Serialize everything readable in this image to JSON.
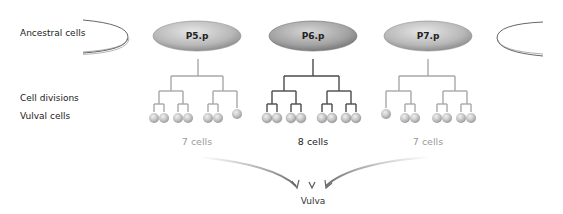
{
  "row_labels": {
    "ancestral": "Ancestral cells",
    "divisions": "Cell divisions",
    "vulval": "Vulval cells"
  },
  "precursors": [
    {
      "name": "P5.p",
      "cell_count_label": "7 cells",
      "cells": 7,
      "emphasis": "faint",
      "line_color": "#a8a8a8"
    },
    {
      "name": "P6.p",
      "cell_count_label": "8 cells",
      "cells": 8,
      "emphasis": "strong",
      "line_color": "#4a4a4a"
    },
    {
      "name": "P7.p",
      "cell_count_label": "7 cells",
      "cells": 7,
      "emphasis": "faint",
      "line_color": "#a8a8a8"
    }
  ],
  "target": "Vulva",
  "colors": {
    "ellipse_fill_light": "#e2e2e2",
    "ellipse_fill_dark": "#9c9c9c",
    "cell_fill": "#c8c8c8",
    "arrow_faint": "#c0c0c0",
    "arrow_strong": "#555555"
  }
}
